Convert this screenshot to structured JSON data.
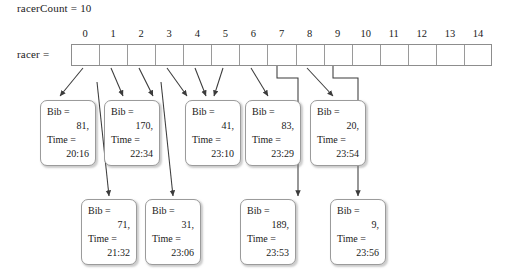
{
  "diagram": {
    "title_text": "racerCount = 10",
    "array_label": "racer =",
    "array": {
      "indices": [
        "0",
        "1",
        "2",
        "3",
        "4",
        "5",
        "6",
        "7",
        "8",
        "9",
        "10",
        "11",
        "12",
        "13",
        "14"
      ],
      "cell_count": 15,
      "occupied_indices": [
        0,
        1,
        2,
        3,
        4,
        5,
        6,
        7,
        8,
        9
      ],
      "empty_indices": [
        10,
        11,
        12,
        13,
        14
      ]
    },
    "colors": {
      "box_border": "#9b9b9b",
      "array_border": "#8d8d8d",
      "wire": "#3b3b3b",
      "text": "#1a1a1a",
      "background": "#ffffff"
    },
    "field_labels": {
      "bib": "Bib =",
      "time": "Time ="
    },
    "nodes_row1": [
      {
        "bib": "81,",
        "time": "20:16",
        "bucket": "0"
      },
      {
        "bib": "170,",
        "time": "22:34",
        "bucket": "1"
      },
      {
        "bib": "41,",
        "time": "23:10",
        "bucket": "4"
      },
      {
        "bib": "83,",
        "time": "23:29",
        "bucket": "6"
      },
      {
        "bib": "20,",
        "time": "23:54",
        "bucket": "9"
      }
    ],
    "nodes_row2": [
      {
        "bib": "71,",
        "time": "21:32"
      },
      {
        "bib": "31,",
        "time": "23:06"
      },
      {
        "bib": "189,",
        "time": "23:53"
      },
      {
        "bib": "9,",
        "time": "23:56"
      }
    ]
  }
}
